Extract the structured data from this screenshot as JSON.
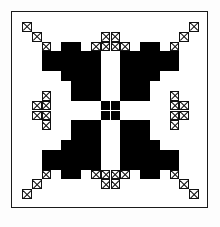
{
  "figure": {
    "colors": {
      "solid_patch": "#000000",
      "hatched_patch_outline": "#111111",
      "background": "#ffffff",
      "frame": "#1a1a1a"
    },
    "frame": {
      "x": 11,
      "y": 11,
      "width": 197,
      "height": 197,
      "stroke_width": 1.2
    },
    "grid": {
      "columns": 20,
      "rows": 20,
      "cell_size": 9.85
    },
    "legend": {
      "solid_label": "solid patch",
      "hatch_label": "cross-hatched patch"
    },
    "pattern": {
      "solid_cells": [
        [
          4,
          3
        ],
        [
          4,
          4
        ],
        [
          5,
          3
        ],
        [
          5,
          4
        ],
        [
          4,
          7
        ],
        [
          4,
          8
        ],
        [
          5,
          7
        ],
        [
          5,
          8
        ],
        [
          3,
          5
        ],
        [
          3,
          6
        ],
        [
          6,
          5
        ],
        [
          6,
          6
        ],
        [
          4,
          5
        ],
        [
          4,
          6
        ],
        [
          5,
          5
        ],
        [
          5,
          6
        ],
        [
          4,
          11
        ],
        [
          4,
          12
        ],
        [
          5,
          11
        ],
        [
          5,
          12
        ],
        [
          4,
          15
        ],
        [
          4,
          16
        ],
        [
          5,
          15
        ],
        [
          5,
          16
        ],
        [
          3,
          13
        ],
        [
          3,
          14
        ],
        [
          6,
          13
        ],
        [
          6,
          14
        ],
        [
          4,
          13
        ],
        [
          4,
          14
        ],
        [
          5,
          13
        ],
        [
          5,
          14
        ],
        [
          14,
          3
        ],
        [
          14,
          4
        ],
        [
          15,
          3
        ],
        [
          15,
          4
        ],
        [
          14,
          7
        ],
        [
          14,
          8
        ],
        [
          15,
          7
        ],
        [
          15,
          8
        ],
        [
          13,
          5
        ],
        [
          13,
          6
        ],
        [
          16,
          5
        ],
        [
          16,
          6
        ],
        [
          14,
          5
        ],
        [
          14,
          6
        ],
        [
          15,
          5
        ],
        [
          15,
          6
        ],
        [
          14,
          11
        ],
        [
          14,
          12
        ],
        [
          15,
          11
        ],
        [
          15,
          12
        ],
        [
          14,
          15
        ],
        [
          14,
          16
        ],
        [
          15,
          15
        ],
        [
          15,
          16
        ],
        [
          13,
          13
        ],
        [
          13,
          14
        ],
        [
          16,
          13
        ],
        [
          16,
          14
        ],
        [
          14,
          13
        ],
        [
          14,
          14
        ],
        [
          15,
          13
        ],
        [
          15,
          14
        ],
        [
          6,
          6
        ],
        [
          6,
          7
        ],
        [
          7,
          6
        ],
        [
          7,
          7
        ],
        [
          8,
          6
        ],
        [
          8,
          7
        ],
        [
          6,
          8
        ],
        [
          7,
          8
        ],
        [
          8,
          8
        ],
        [
          6,
          11
        ],
        [
          6,
          12
        ],
        [
          6,
          13
        ],
        [
          7,
          11
        ],
        [
          7,
          12
        ],
        [
          7,
          13
        ],
        [
          8,
          11
        ],
        [
          8,
          12
        ],
        [
          8,
          13
        ],
        [
          11,
          6
        ],
        [
          11,
          7
        ],
        [
          11,
          8
        ],
        [
          12,
          6
        ],
        [
          12,
          7
        ],
        [
          12,
          8
        ],
        [
          13,
          6
        ],
        [
          13,
          7
        ],
        [
          13,
          8
        ],
        [
          11,
          11
        ],
        [
          11,
          12
        ],
        [
          11,
          13
        ],
        [
          12,
          11
        ],
        [
          12,
          12
        ],
        [
          12,
          13
        ],
        [
          13,
          11
        ],
        [
          13,
          12
        ],
        [
          13,
          13
        ],
        [
          9,
          9
        ],
        [
          9,
          10
        ],
        [
          10,
          9
        ],
        [
          10,
          10
        ]
      ],
      "hatched_cells": [
        [
          1,
          1
        ],
        [
          2,
          2
        ],
        [
          3,
          3
        ],
        [
          4,
          4
        ],
        [
          1,
          18
        ],
        [
          2,
          17
        ],
        [
          3,
          16
        ],
        [
          4,
          15
        ],
        [
          18,
          1
        ],
        [
          17,
          2
        ],
        [
          16,
          3
        ],
        [
          15,
          4
        ],
        [
          18,
          18
        ],
        [
          17,
          17
        ],
        [
          16,
          16
        ],
        [
          15,
          15
        ],
        [
          3,
          8
        ],
        [
          3,
          9
        ],
        [
          3,
          10
        ],
        [
          3,
          11
        ],
        [
          4,
          3
        ],
        [
          4,
          16
        ],
        [
          8,
          3
        ],
        [
          9,
          3
        ],
        [
          10,
          3
        ],
        [
          11,
          3
        ],
        [
          8,
          16
        ],
        [
          9,
          16
        ],
        [
          10,
          16
        ],
        [
          11,
          16
        ],
        [
          16,
          8
        ],
        [
          16,
          9
        ],
        [
          16,
          10
        ],
        [
          16,
          11
        ],
        [
          2,
          9
        ],
        [
          2,
          10
        ],
        [
          17,
          9
        ],
        [
          17,
          10
        ],
        [
          9,
          2
        ],
        [
          10,
          2
        ],
        [
          9,
          17
        ],
        [
          10,
          17
        ]
      ]
    }
  }
}
